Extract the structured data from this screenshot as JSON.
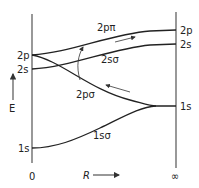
{
  "diagram": {
    "axes": {
      "energy_label": "E",
      "x_label": "R",
      "left_tick": "0",
      "right_tick": "∞"
    },
    "left_levels": {
      "l2p": "2p",
      "l2s": "2s",
      "l1s": "1s"
    },
    "right_levels": {
      "r2p": "2p",
      "r2s": "2s",
      "r1s": "1s"
    },
    "orbitals": {
      "o2ppi": "2pπ",
      "o2ssigma": "2sσ",
      "o2psigma": "2pσ",
      "o1ssigma": "1sσ"
    }
  }
}
